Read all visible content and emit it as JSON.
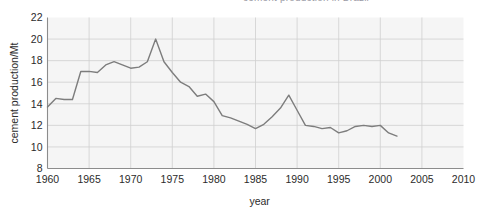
{
  "figure": {
    "clipped_caption_top": "cement production in Brazil",
    "background_color": "#ffffff",
    "plot_background_color": "#f5f5f5",
    "grid_color": "#cfcfcf",
    "axis_color": "#8c8c8c",
    "line_color": "#7d7d7d"
  },
  "chart_data": {
    "type": "line",
    "title": "",
    "xlabel": "year",
    "ylabel": "cement production/Mt",
    "xlim": [
      1960,
      2010
    ],
    "ylim": [
      8,
      22
    ],
    "xticks": [
      1960,
      1965,
      1970,
      1975,
      1980,
      1985,
      1990,
      1995,
      2000,
      2005,
      2010
    ],
    "yticks": [
      8,
      10,
      12,
      14,
      16,
      18,
      20,
      22
    ],
    "xtick_labels": [
      "1960",
      "1965",
      "1970",
      "1975",
      "1980",
      "1985",
      "1990",
      "1995",
      "2000",
      "2005",
      "2010"
    ],
    "ytick_labels": [
      "8",
      "10",
      "12",
      "14",
      "16",
      "18",
      "20",
      "22"
    ],
    "grid": true,
    "legend": null,
    "series": [
      {
        "name": "cement production",
        "color": "#7d7d7d",
        "x": [
          1960,
          1961,
          1962,
          1963,
          1964,
          1965,
          1966,
          1967,
          1968,
          1969,
          1970,
          1971,
          1972,
          1973,
          1974,
          1975,
          1976,
          1977,
          1978,
          1979,
          1980,
          1981,
          1982,
          1983,
          1984,
          1985,
          1986,
          1987,
          1988,
          1989,
          1990,
          1991,
          1992,
          1993,
          1994,
          1995,
          1996,
          1997,
          1998,
          1999,
          2000,
          2001,
          2002
        ],
        "y": [
          13.7,
          14.5,
          14.4,
          14.4,
          17.0,
          17.0,
          16.9,
          17.6,
          17.9,
          17.6,
          17.3,
          17.4,
          17.9,
          20.0,
          17.9,
          16.9,
          16.0,
          15.6,
          14.7,
          14.9,
          14.2,
          12.9,
          12.7,
          12.4,
          12.1,
          11.7,
          12.1,
          12.8,
          13.6,
          14.8,
          13.4,
          12.0,
          11.9,
          11.7,
          11.8,
          11.3,
          11.5,
          11.9,
          12.0,
          11.9,
          12.0,
          11.3,
          11.0
        ]
      }
    ]
  }
}
